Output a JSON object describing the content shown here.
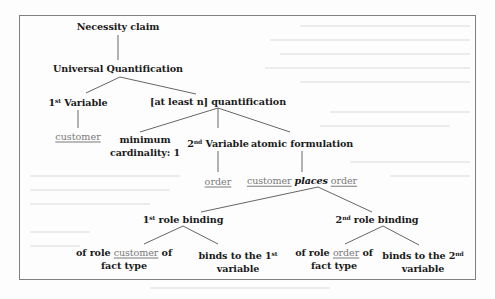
{
  "diagram": {
    "type": "tree",
    "colors": {
      "text": "#1a1a1a",
      "term": "#7a7a7a",
      "edge": "#666666",
      "frame": "#808080",
      "background": "#fdfdfd"
    },
    "nodes": {
      "root": {
        "label": "Necessity claim"
      },
      "universal": {
        "label": "Universal Quantification"
      },
      "var1": {
        "ordinal": "1",
        "ordinal_suffix": "st",
        "label": "Variable"
      },
      "var1_term": {
        "label": "customer"
      },
      "atleast": {
        "label": "[at least n] quantification"
      },
      "mincard": {
        "line1": "minimum",
        "line2": "cardinality: 1"
      },
      "var2": {
        "ordinal": "2",
        "ordinal_suffix": "nd",
        "label": "Variable"
      },
      "var2_term": {
        "label": "order"
      },
      "atomic": {
        "label": "atomic formulation"
      },
      "fact": {
        "subject": "customer",
        "verb": "places",
        "object": "order"
      },
      "rb1": {
        "ordinal": "1",
        "ordinal_suffix": "st",
        "label": "role binding"
      },
      "rb1_role": {
        "prefix": "of role",
        "term": "customer",
        "suffix": "of",
        "line2": "fact type"
      },
      "rb1_binds": {
        "line1_text": "binds to the 1",
        "line1_suffix": "st",
        "line2": "variable"
      },
      "rb2": {
        "ordinal": "2",
        "ordinal_suffix": "nd",
        "label": "role binding"
      },
      "rb2_role": {
        "prefix": "of role",
        "term": "order",
        "suffix": "of",
        "line2": "fact type"
      },
      "rb2_binds": {
        "line1_text": "binds to the 2",
        "line1_suffix": "nd",
        "line2": "variable"
      }
    },
    "edges": [
      [
        "root",
        "universal"
      ],
      [
        "universal",
        "var1"
      ],
      [
        "universal",
        "atleast"
      ],
      [
        "var1",
        "var1_term"
      ],
      [
        "atleast",
        "mincard"
      ],
      [
        "atleast",
        "var2"
      ],
      [
        "atleast",
        "atomic"
      ],
      [
        "var2",
        "var2_term"
      ],
      [
        "atomic",
        "fact"
      ],
      [
        "fact",
        "rb1"
      ],
      [
        "fact",
        "rb2"
      ],
      [
        "rb1",
        "rb1_role"
      ],
      [
        "rb1",
        "rb1_binds"
      ],
      [
        "rb2",
        "rb2_role"
      ],
      [
        "rb2",
        "rb2_binds"
      ]
    ]
  }
}
